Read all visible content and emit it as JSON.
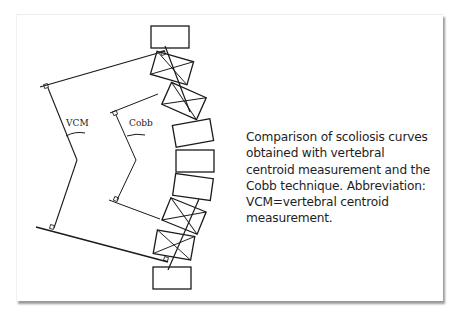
{
  "figure": {
    "labels": {
      "vcm": "VCM",
      "cobb": "Cobb"
    },
    "caption": "Comparison of scoliosis curves obtained with vertebral centroid measurement and the Cobb technique. Abbreviation: VCM=vertebral centroid measurement.",
    "vertebrae": [
      {
        "index": 1,
        "marked": false
      },
      {
        "index": 2,
        "marked": true
      },
      {
        "index": 3,
        "marked": true
      },
      {
        "index": 4,
        "marked": false
      },
      {
        "index": 5,
        "marked": false
      },
      {
        "index": 6,
        "marked": false
      },
      {
        "index": 7,
        "marked": true
      },
      {
        "index": 8,
        "marked": true
      },
      {
        "index": 9,
        "marked": false
      }
    ],
    "colors": {
      "line": "#1a1a1a",
      "background": "#ffffff",
      "shadow": "#9a9a9a"
    }
  }
}
